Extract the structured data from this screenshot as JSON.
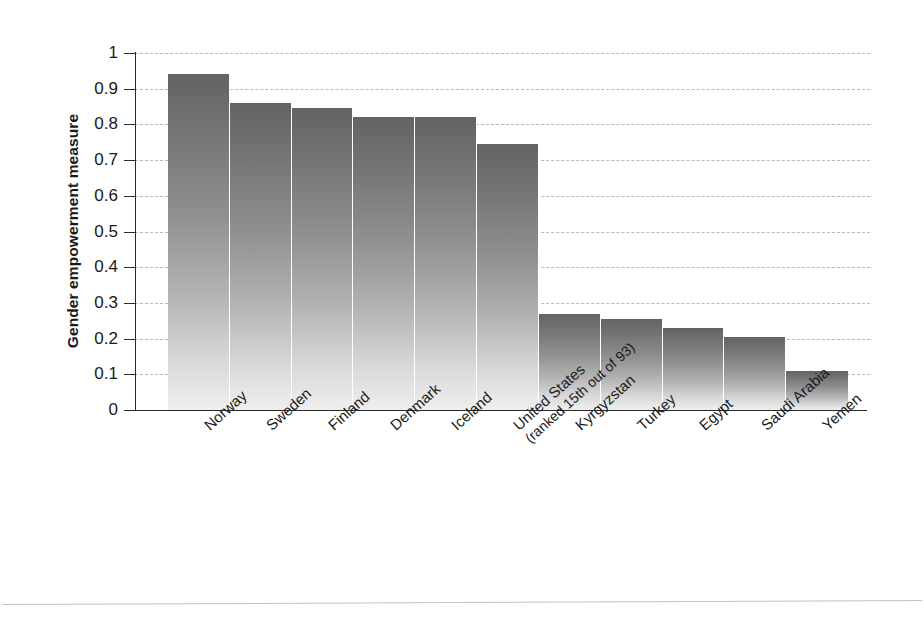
{
  "chart_data": {
    "type": "bar",
    "title": "",
    "xlabel": "",
    "ylabel": "Gender empowerment measure",
    "ylim": [
      0,
      1
    ],
    "ytick_labels": [
      "1",
      "0.9",
      "0.8",
      "0.7",
      "0.6",
      "0.5",
      "0.4",
      "0.3",
      "0.2",
      "0.1",
      "0"
    ],
    "ytick_values": [
      1,
      0.9,
      0.8,
      0.7,
      0.6,
      0.5,
      0.4,
      0.3,
      0.2,
      0.1,
      0
    ],
    "grid": true,
    "grid_axis": "y",
    "grid_style": "dashed",
    "legend": false,
    "bar_fill": "vertical-gradient-dark-gray-to-light-gray",
    "bar_color_top": "#636363",
    "bar_color_bottom": "#efefef",
    "categories": [
      "Norway",
      "Sweden",
      "Finland",
      "Denmark",
      "Iceland",
      "United States",
      "Kyrgyzstan",
      "Turkey",
      "Egypt",
      "Saudi Arabia",
      "Yemen"
    ],
    "category_sublabels": [
      "",
      "",
      "",
      "",
      "",
      "(ranked 15th out of 93)",
      "",
      "",
      "",
      "",
      ""
    ],
    "values": [
      0.94,
      0.86,
      0.845,
      0.82,
      0.82,
      0.745,
      0.27,
      0.255,
      0.23,
      0.205,
      0.11
    ]
  }
}
